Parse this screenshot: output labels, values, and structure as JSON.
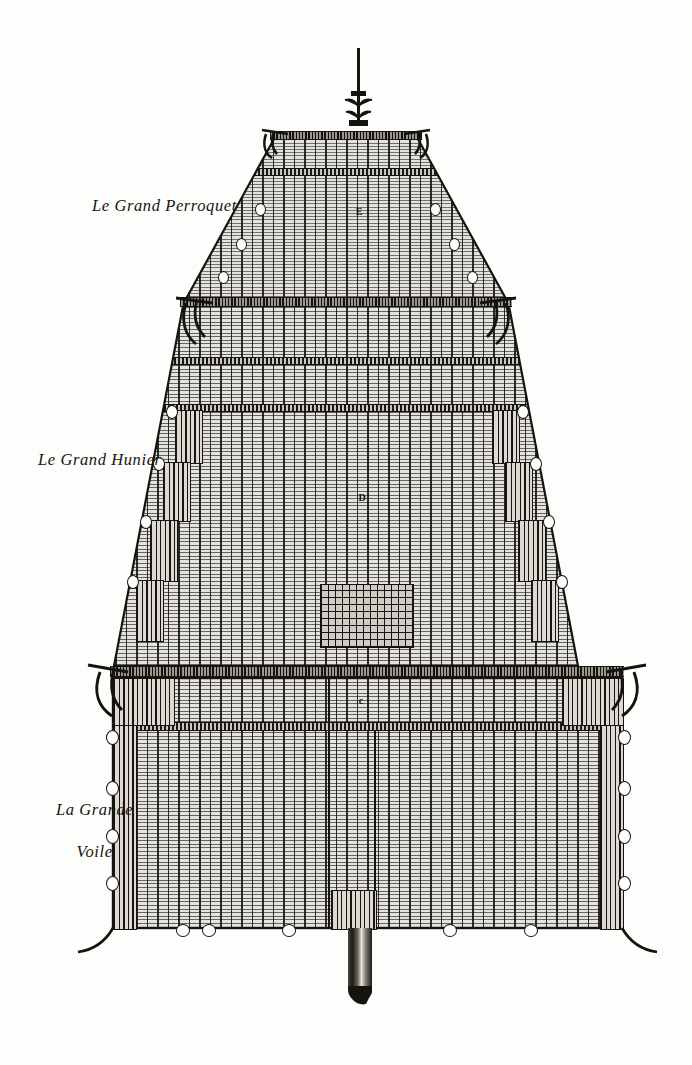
{
  "plate": {
    "title": "Le Grand Perroquet",
    "description": "Engraved plate of the three square sails of a ship's mainmast",
    "background_color": "#fdfdfc",
    "ink_color": "#15130e",
    "cloth_color": "#d9d7d2"
  },
  "captions": [
    {
      "id": "topgallant",
      "label": "Le Grand Perroquet",
      "x": 92,
      "y": 196
    },
    {
      "id": "topsail",
      "label": "Le Grand Hunier",
      "x": 38,
      "y": 450
    },
    {
      "id": "mainsail",
      "line1": "La Grande",
      "line2": "Voile",
      "x": 37,
      "y": 778
    }
  ],
  "sail_marks": [
    {
      "id": "mark-topgallant",
      "label": "E",
      "x": 359,
      "y": 211
    },
    {
      "id": "mark-topsail",
      "label": "D",
      "x": 362,
      "y": 497
    },
    {
      "id": "mark-mainsail",
      "label": "c",
      "x": 361,
      "y": 700
    }
  ],
  "sails": [
    {
      "name": "topgallant-sail",
      "french": "Le Grand Perroquet",
      "top_width": 172,
      "bottom_width": 312,
      "top_y": 137,
      "bottom_y": 300,
      "reef_bands": 1
    },
    {
      "name": "topsail",
      "french": "Le Grand Hunier",
      "top_width": 330,
      "bottom_width": 520,
      "top_y": 303,
      "bottom_y": 668,
      "reef_bands": 2
    },
    {
      "name": "main-sail",
      "french": "La Grande Voile",
      "top_width": 520,
      "bottom_width": 520,
      "top_y": 676,
      "bottom_y": 930,
      "reef_bands": 1
    }
  ],
  "spars": [
    {
      "name": "topgallant-yard",
      "y": 133,
      "half_span": 95
    },
    {
      "name": "topsail-yard",
      "y": 300,
      "half_span": 182
    },
    {
      "name": "main-yard",
      "y": 668,
      "half_span": 280
    }
  ],
  "mast": {
    "name": "main-mast",
    "truck_top_y": 48,
    "heel_bottom_y": 1005
  }
}
